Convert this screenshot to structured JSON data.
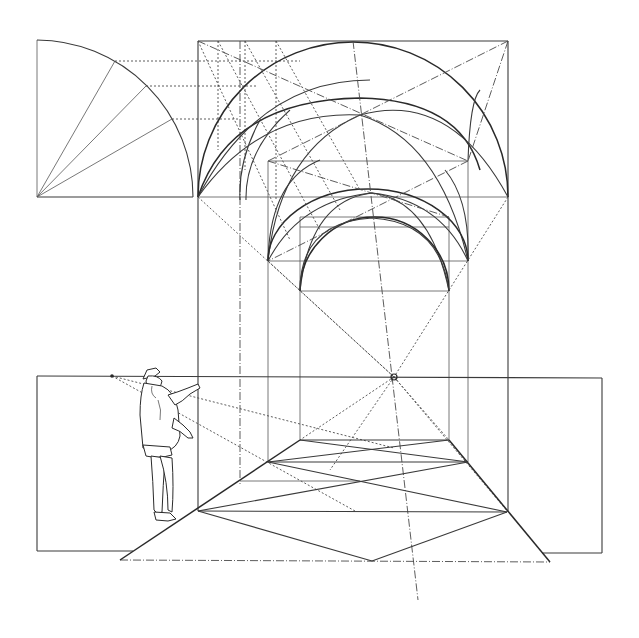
{
  "figure": {
    "type": "perspective construction drawing",
    "alt_text": "Perspective construction of a groin-vaulted bay with quarter-circle elevation, horizon line, vanishing point, tiled floor diagonals, and a standing observer pointing toward the picture plane"
  },
  "colors": {
    "ink": "#2a2a2a",
    "paper": "#ffffff"
  },
  "elements": {
    "quarter_circle": {
      "center": [
        37,
        197
      ],
      "radius": 158,
      "division_points": 3
    },
    "front_frame": {
      "x1": 198,
      "y1": 41,
      "x2": 508,
      "y2": 197
    },
    "horizon_y": 377,
    "vanishing_point": [
      394,
      377
    ],
    "ground_line_y": 561,
    "observer": {
      "eye_point": [
        112,
        376
      ]
    }
  }
}
